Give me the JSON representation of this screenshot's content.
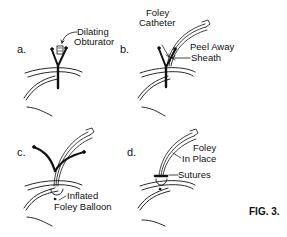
{
  "figure": {
    "caption": "FIG. 3.",
    "panels": [
      {
        "letter": "a.",
        "labels": [
          "Dilating",
          "Obturator"
        ]
      },
      {
        "letter": "b.",
        "labels": [
          "Foley",
          "Catheter",
          "Peel Away",
          "Sheath"
        ]
      },
      {
        "letter": "c.",
        "labels": [
          "Inflated",
          "Foley Balloon"
        ]
      },
      {
        "letter": "d.",
        "labels": [
          "Foley",
          "In Place",
          "Sutures"
        ]
      }
    ]
  },
  "colors": {
    "ink": "#111111",
    "background": "#ffffff"
  }
}
